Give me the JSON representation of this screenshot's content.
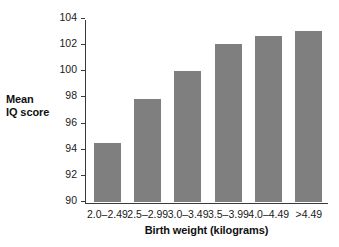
{
  "chart_data": {
    "type": "bar",
    "title": "",
    "xlabel": "Birth weight (kilograms)",
    "ylabel": "Mean IQ score",
    "categories": [
      "2.0–2.49",
      "2.5–2.99",
      "3.0–3.49",
      "3.5–3.99",
      "4.0–4.49",
      ">4.49"
    ],
    "values": [
      94.5,
      97.9,
      100.0,
      102.1,
      102.7,
      103.05
    ],
    "ylim": [
      90,
      104
    ],
    "yticks": [
      90,
      92,
      94,
      96,
      98,
      100,
      102,
      104
    ],
    "ytick_labels": [
      "90",
      "92",
      "94",
      "96",
      "98",
      "100",
      "102",
      "104"
    ],
    "grid": false,
    "legend": false,
    "bar_color": "#7f7f7f",
    "axis_color": "#3a3a3a",
    "background": "#ffffff"
  },
  "axis_titles": {
    "y_line1": "Mean",
    "y_line2": "IQ score",
    "x": "Birth weight (kilograms)"
  }
}
